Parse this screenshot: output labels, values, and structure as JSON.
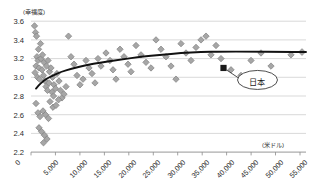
{
  "chart_data": {
    "type": "scatter",
    "title": "",
    "xlabel": "(米ドル)",
    "ylabel": "(幸福度)",
    "xlim": [
      0,
      55000
    ],
    "ylim": [
      2.2,
      3.6
    ],
    "grid": true,
    "legend": "none",
    "xticks": [
      "0",
      "5,000",
      "10,000",
      "15,000",
      "20,000",
      "25,000",
      "30,000",
      "35,000",
      "40,000",
      "45,000",
      "50,000",
      "55,000"
    ],
    "yticks": [
      "2.2",
      "2.4",
      "2.6",
      "2.8",
      "3.0",
      "3.2",
      "3.4",
      "3.6"
    ],
    "series": [
      {
        "name": "countries",
        "marker": "diamond",
        "color": "#a6a6a6",
        "edge_color": "#808080",
        "points": [
          [
            700,
            3.55
          ],
          [
            900,
            3.48
          ],
          [
            1100,
            3.44
          ],
          [
            1500,
            3.3
          ],
          [
            1900,
            3.36
          ],
          [
            1200,
            3.22
          ],
          [
            1400,
            3.18
          ],
          [
            1000,
            3.12
          ],
          [
            1600,
            3.1
          ],
          [
            800,
            3.05
          ],
          [
            1300,
            3.0
          ],
          [
            1700,
            2.98
          ],
          [
            2000,
            3.2
          ],
          [
            2300,
            3.24
          ],
          [
            2600,
            3.16
          ],
          [
            2200,
            3.08
          ],
          [
            2500,
            3.02
          ],
          [
            2800,
            2.96
          ],
          [
            3100,
            3.12
          ],
          [
            3400,
            3.18
          ],
          [
            3700,
            3.06
          ],
          [
            3000,
            2.9
          ],
          [
            3300,
            2.86
          ],
          [
            3600,
            2.94
          ],
          [
            4000,
            3.1
          ],
          [
            4300,
            3.0
          ],
          [
            4600,
            2.92
          ],
          [
            4200,
            2.84
          ],
          [
            4500,
            2.8
          ],
          [
            4900,
            2.88
          ],
          [
            5200,
            3.04
          ],
          [
            5600,
            2.96
          ],
          [
            5900,
            2.86
          ],
          [
            6200,
            2.78
          ],
          [
            6600,
            2.82
          ],
          [
            7000,
            2.9
          ],
          [
            1000,
            2.72
          ],
          [
            1400,
            2.62
          ],
          [
            1800,
            2.58
          ],
          [
            2400,
            2.64
          ],
          [
            2900,
            2.6
          ],
          [
            3500,
            2.56
          ],
          [
            1600,
            2.46
          ],
          [
            2100,
            2.42
          ],
          [
            2700,
            2.38
          ],
          [
            3200,
            2.34
          ],
          [
            2500,
            2.3
          ],
          [
            3800,
            2.74
          ],
          [
            4400,
            2.68
          ],
          [
            5000,
            2.7
          ],
          [
            5500,
            2.76
          ],
          [
            7500,
            3.44
          ],
          [
            8000,
            3.22
          ],
          [
            8600,
            3.14
          ],
          [
            9200,
            3.02
          ],
          [
            9800,
            2.92
          ],
          [
            10400,
            2.98
          ],
          [
            11000,
            3.18
          ],
          [
            11600,
            3.1
          ],
          [
            12200,
            3.04
          ],
          [
            12800,
            2.94
          ],
          [
            13400,
            3.2
          ],
          [
            14000,
            3.12
          ],
          [
            15000,
            3.26
          ],
          [
            15800,
            3.18
          ],
          [
            16400,
            3.08
          ],
          [
            17000,
            2.98
          ],
          [
            17800,
            3.3
          ],
          [
            18600,
            3.22
          ],
          [
            19400,
            3.14
          ],
          [
            20000,
            3.06
          ],
          [
            21000,
            3.34
          ],
          [
            22000,
            3.24
          ],
          [
            23000,
            3.16
          ],
          [
            24000,
            3.1
          ],
          [
            25000,
            3.4
          ],
          [
            26000,
            3.3
          ],
          [
            27000,
            3.22
          ],
          [
            28000,
            3.12
          ],
          [
            29000,
            2.98
          ],
          [
            30000,
            3.36
          ],
          [
            31000,
            3.26
          ],
          [
            32000,
            3.18
          ],
          [
            33000,
            3.32
          ],
          [
            34000,
            3.4
          ],
          [
            35000,
            3.44
          ],
          [
            36000,
            3.24
          ],
          [
            37000,
            3.34
          ],
          [
            38000,
            3.2
          ],
          [
            40000,
            3.08
          ],
          [
            42000,
            3.02
          ],
          [
            44000,
            3.18
          ],
          [
            46000,
            3.26
          ],
          [
            48000,
            3.12
          ],
          [
            52000,
            3.24
          ]
        ]
      },
      {
        "name": "japan",
        "marker": "square",
        "color": "#1a1a1a",
        "points": [
          [
            38500,
            3.1
          ]
        ]
      }
    ],
    "trendline": {
      "name": "logarithmic-fit",
      "color": "#111111",
      "points": [
        [
          1000,
          2.88
        ],
        [
          2000,
          2.94
        ],
        [
          3000,
          2.98
        ],
        [
          4000,
          3.01
        ],
        [
          6000,
          3.06
        ],
        [
          8000,
          3.09
        ],
        [
          11000,
          3.13
        ],
        [
          14000,
          3.16
        ],
        [
          18000,
          3.19
        ],
        [
          22000,
          3.22
        ],
        [
          26000,
          3.24
        ],
        [
          30000,
          3.26
        ],
        [
          34000,
          3.27
        ],
        [
          38000,
          3.275
        ],
        [
          44000,
          3.275
        ],
        [
          50000,
          3.272
        ],
        [
          55000,
          3.27
        ]
      ]
    },
    "annotations": [
      {
        "name": "japan-callout",
        "label": "日本",
        "shape": "ellipse",
        "target_point": [
          38500,
          3.1
        ]
      }
    ]
  }
}
